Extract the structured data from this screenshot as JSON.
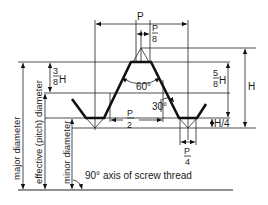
{
  "diagram": {
    "labels": {
      "pitch": "P",
      "crest_flat_num": "P",
      "crest_flat_den": "8",
      "half_pitch_num": "P",
      "half_pitch_den": "2",
      "root_flat_num": "P",
      "root_flat_den": "4",
      "height": "H",
      "three_eighths_num": "3",
      "three_eighths_den": "8",
      "three_eighths_suffix": "H",
      "five_eighths_num": "5",
      "five_eighths_den": "8",
      "five_eighths_suffix": "H",
      "quarter_height": "H/4",
      "included_angle": "60°",
      "flank_angle": "30°",
      "major_diameter": "major diameter",
      "effective_diameter": "effective (pitch) diameter",
      "minor_diameter": "minor diameter",
      "axis_note": "90° axis of screw thread"
    },
    "colors": {
      "line": "#111111",
      "background": "#ffffff"
    }
  }
}
